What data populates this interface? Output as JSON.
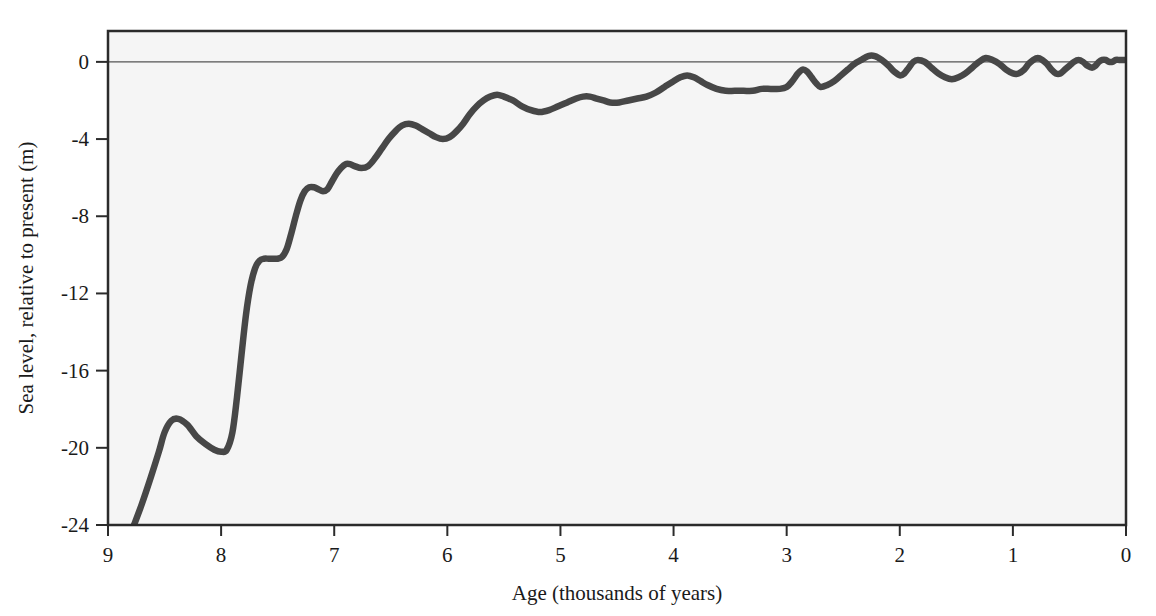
{
  "figure": {
    "background_color": "#ffffff",
    "plot_background_color": "#f5f5f5",
    "frame_color": "#2b2b2b",
    "curve_color": "#474747",
    "zero_line_color": "#555555"
  },
  "chart_data": {
    "type": "line",
    "title": "",
    "xlabel": "Age (thousands of years)",
    "ylabel": "Sea level, relative to present (m)",
    "xlim": [
      9,
      0
    ],
    "ylim": [
      -24,
      1.6
    ],
    "x_reversed": true,
    "grid": false,
    "legend": null,
    "xticks": [
      9,
      8,
      7,
      6,
      5,
      4,
      3,
      2,
      1,
      0
    ],
    "xtick_labels": [
      "9",
      "8",
      "7",
      "6",
      "5",
      "4",
      "3",
      "2",
      "1",
      "0"
    ],
    "yticks": [
      0,
      -4,
      -8,
      -12,
      -16,
      -20,
      -24
    ],
    "ytick_labels": [
      "0",
      "-4",
      "-8",
      "-12",
      "-16",
      "-20",
      "-24"
    ],
    "annotations": [
      {
        "text": "zero reference line at 0 m",
        "y": 0
      }
    ],
    "series": [
      {
        "name": "Sea level",
        "x": [
          8.77,
          8.7,
          8.62,
          8.55,
          8.5,
          8.44,
          8.38,
          8.3,
          8.22,
          8.14,
          8.06,
          8.0,
          7.95,
          7.9,
          7.86,
          7.82,
          7.78,
          7.74,
          7.7,
          7.66,
          7.62,
          7.58,
          7.54,
          7.5,
          7.46,
          7.42,
          7.38,
          7.34,
          7.3,
          7.26,
          7.22,
          7.18,
          7.14,
          7.1,
          7.06,
          7.02,
          6.98,
          6.94,
          6.9,
          6.86,
          6.82,
          6.76,
          6.7,
          6.64,
          6.58,
          6.52,
          6.46,
          6.4,
          6.34,
          6.28,
          6.22,
          6.16,
          6.1,
          6.04,
          5.98,
          5.92,
          5.86,
          5.8,
          5.74,
          5.68,
          5.62,
          5.56,
          5.5,
          5.42,
          5.34,
          5.26,
          5.18,
          5.1,
          5.02,
          4.94,
          4.86,
          4.8,
          4.74,
          4.68,
          4.62,
          4.56,
          4.48,
          4.4,
          4.32,
          4.24,
          4.16,
          4.08,
          4.0,
          3.94,
          3.88,
          3.82,
          3.76,
          3.7,
          3.62,
          3.54,
          3.46,
          3.38,
          3.3,
          3.22,
          3.14,
          3.06,
          3.0,
          2.95,
          2.9,
          2.86,
          2.82,
          2.78,
          2.74,
          2.7,
          2.64,
          2.58,
          2.52,
          2.46,
          2.4,
          2.34,
          2.28,
          2.22,
          2.16,
          2.1,
          2.05,
          2.0,
          1.96,
          1.92,
          1.88,
          1.84,
          1.78,
          1.72,
          1.66,
          1.6,
          1.54,
          1.48,
          1.42,
          1.36,
          1.3,
          1.24,
          1.18,
          1.12,
          1.06,
          1.0,
          0.95,
          0.9,
          0.86,
          0.82,
          0.78,
          0.74,
          0.7,
          0.66,
          0.62,
          0.58,
          0.54,
          0.5,
          0.46,
          0.42,
          0.38,
          0.34,
          0.3,
          0.27,
          0.24,
          0.21,
          0.18,
          0.15,
          0.12,
          0.09,
          0.06,
          0.03,
          0.0
        ],
        "y": [
          -24.0,
          -22.9,
          -21.5,
          -20.2,
          -19.2,
          -18.6,
          -18.5,
          -18.8,
          -19.4,
          -19.8,
          -20.1,
          -20.2,
          -20.1,
          -19.2,
          -17.4,
          -15.2,
          -13.1,
          -11.6,
          -10.7,
          -10.3,
          -10.2,
          -10.2,
          -10.2,
          -10.2,
          -10.1,
          -9.7,
          -8.9,
          -8.0,
          -7.2,
          -6.7,
          -6.5,
          -6.5,
          -6.6,
          -6.7,
          -6.6,
          -6.2,
          -5.8,
          -5.5,
          -5.3,
          -5.3,
          -5.4,
          -5.5,
          -5.4,
          -5.0,
          -4.5,
          -4.0,
          -3.6,
          -3.3,
          -3.2,
          -3.3,
          -3.5,
          -3.7,
          -3.9,
          -4.0,
          -3.9,
          -3.6,
          -3.2,
          -2.7,
          -2.3,
          -2.0,
          -1.8,
          -1.7,
          -1.8,
          -2.0,
          -2.3,
          -2.5,
          -2.6,
          -2.5,
          -2.3,
          -2.1,
          -1.9,
          -1.8,
          -1.8,
          -1.9,
          -2.0,
          -2.1,
          -2.1,
          -2.0,
          -1.9,
          -1.8,
          -1.6,
          -1.3,
          -1.0,
          -0.8,
          -0.7,
          -0.8,
          -1.0,
          -1.2,
          -1.4,
          -1.5,
          -1.5,
          -1.5,
          -1.5,
          -1.4,
          -1.4,
          -1.4,
          -1.3,
          -1.0,
          -0.6,
          -0.4,
          -0.5,
          -0.8,
          -1.1,
          -1.3,
          -1.2,
          -1.0,
          -0.7,
          -0.4,
          -0.1,
          0.1,
          0.3,
          0.3,
          0.1,
          -0.2,
          -0.5,
          -0.7,
          -0.6,
          -0.3,
          0.0,
          0.1,
          0.0,
          -0.3,
          -0.6,
          -0.8,
          -0.9,
          -0.8,
          -0.6,
          -0.3,
          0.0,
          0.2,
          0.1,
          -0.1,
          -0.4,
          -0.6,
          -0.6,
          -0.4,
          -0.1,
          0.1,
          0.2,
          0.1,
          -0.1,
          -0.4,
          -0.6,
          -0.6,
          -0.4,
          -0.2,
          0.0,
          0.1,
          0.0,
          -0.2,
          -0.3,
          -0.2,
          0.0,
          0.1,
          0.1,
          0.0,
          0.0,
          0.1,
          0.1,
          0.1,
          0.1
        ]
      }
    ]
  }
}
